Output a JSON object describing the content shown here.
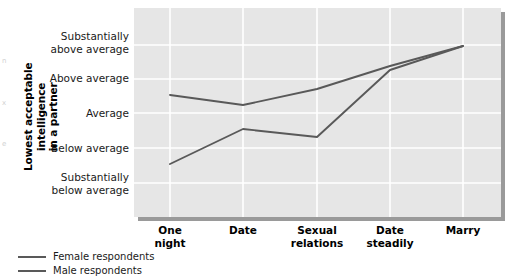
{
  "chart_data": {
    "type": "line",
    "title": "",
    "xlabel": "",
    "ylabel": "Lowest acceptable intelligence in a partner",
    "categories": [
      "One night",
      "Date",
      "Sexual relations",
      "Date steadily",
      "Marry"
    ],
    "ytick_labels": [
      "Substantially above average",
      "Above average",
      "Average",
      "Below average",
      "Substantially below average"
    ],
    "ylim": [
      -2,
      2
    ],
    "ytick_values": [
      2,
      1,
      0,
      -1,
      -2
    ],
    "grid": true,
    "legend_position": "below-left",
    "series": [
      {
        "name": "Female respondents",
        "color": "#595959",
        "values": [
          0.48,
          0.22,
          0.68,
          1.34,
          1.92
        ]
      },
      {
        "name": "Male respondents",
        "color": "#595959",
        "values": [
          -1.45,
          -0.46,
          -0.68,
          1.24,
          1.92
        ]
      }
    ],
    "series_points_px": {
      "x": [
        170,
        243,
        317,
        390,
        463
      ],
      "Female respondents": [
        95,
        105,
        89,
        66,
        46
      ],
      "Male respondents": [
        164,
        129,
        137,
        70,
        46
      ]
    },
    "plot_background": "#e6e6e6",
    "gridline_color": "#ffffff",
    "line_color": "#595959"
  },
  "y_axis": {
    "title_line1": "Lowest acceptable intelligence",
    "title_line2": "in a partner",
    "ticks": [
      {
        "line1": "Substantially",
        "line2": "above average"
      },
      {
        "line1": "Above average",
        "line2": ""
      },
      {
        "line1": "Average",
        "line2": ""
      },
      {
        "line1": "Below average",
        "line2": ""
      },
      {
        "line1": "Substantially",
        "line2": "below average"
      }
    ]
  },
  "x_axis": {
    "ticks": [
      {
        "line1": "One",
        "line2": "night"
      },
      {
        "line1": "Date",
        "line2": ""
      },
      {
        "line1": "Sexual",
        "line2": "relations"
      },
      {
        "line1": "Date",
        "line2": "steadily"
      },
      {
        "line1": "Marry",
        "line2": ""
      }
    ]
  },
  "legend": {
    "items": [
      {
        "label": "Female respondents"
      },
      {
        "label": "Male respondents"
      }
    ]
  },
  "bleed_fragments": [
    "n",
    "x",
    "e"
  ]
}
